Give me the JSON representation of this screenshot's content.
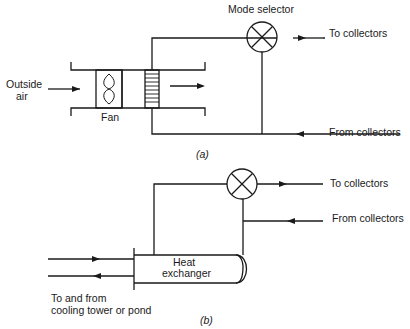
{
  "diagram_a": {
    "labels": {
      "mode_selector": "Mode selector",
      "to_collectors": "To collectors",
      "from_collectors": "From collectors",
      "outside_air_1": "Outside",
      "outside_air_2": "air",
      "fan": "Fan"
    },
    "caption": "(a)"
  },
  "diagram_b": {
    "labels": {
      "to_collectors": "To collectors",
      "from_collectors": "From collectors",
      "heat_exchanger_1": "Heat",
      "heat_exchanger_2": "exchanger",
      "cooling_1": "To and from",
      "cooling_2": "cooling tower or pond"
    },
    "caption": "(b)"
  },
  "colors": {
    "line": "#1a1a1a",
    "background": "#ffffff"
  }
}
